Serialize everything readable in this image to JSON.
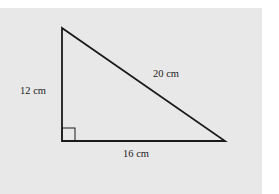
{
  "diagram": {
    "labels": {
      "vertical_side": "12 cm",
      "hypotenuse": "20 cm",
      "base": "16 cm"
    },
    "right_angle_marker": true,
    "colors": {
      "background": "#e8e8e8",
      "stroke": "#1a1a1a"
    }
  }
}
